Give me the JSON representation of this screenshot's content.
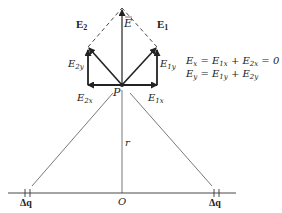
{
  "vectors": {
    "E_label": "E",
    "E1_label": "E",
    "E1_sub": "1",
    "E2_label": "E",
    "E2_sub": "2",
    "E1x_label": "E",
    "E1x_sub": "1x",
    "E1y_label": "E",
    "E1y_sub": "1y",
    "E2x_label": "E",
    "E2x_sub": "2x",
    "E2y_label": "E",
    "E2y_sub": "2y"
  },
  "points": {
    "P_label": "P",
    "O_label": "O",
    "r_label": "r",
    "dq_left": "Δq",
    "dq_right": "Δq"
  },
  "equations": {
    "ex": "E",
    "ex_sub": "x",
    "ex_rhs1": " = E",
    "ex_rhs1_sub": "1x",
    "ex_rhs2": " + E",
    "ex_rhs2_sub": "2x",
    "ex_rhs3": " = 0",
    "ey": "E",
    "ey_sub": "y",
    "ey_rhs1": " = E",
    "ey_rhs1_sub": "1y",
    "ey_rhs2": " + E",
    "ey_rhs2_sub": "2y"
  },
  "colors": {
    "line": "#222222",
    "thin": "#555555"
  }
}
